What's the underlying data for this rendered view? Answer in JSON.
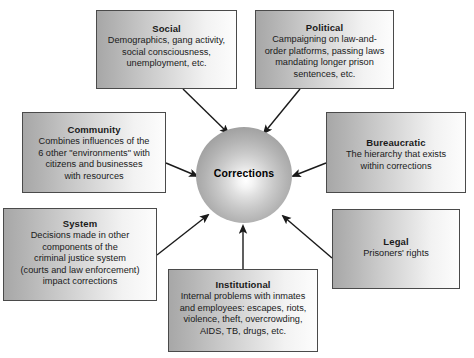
{
  "diagram": {
    "center": {
      "label": "Corrections",
      "shape": "sphere"
    },
    "colors": {
      "box_border": "#4a4a4a",
      "box_gradient_from": "#a7a7a7",
      "box_gradient_to": "#fdfdfd",
      "arrow": "#1a1a1a",
      "text": "#1a1a1a",
      "background": "#ffffff"
    },
    "nodes": [
      {
        "id": "social",
        "title": "Social",
        "body": "Demographics, gang activity,\nsocial consciousness,\nunemployment, etc."
      },
      {
        "id": "political",
        "title": "Political",
        "body": "Campaigning on law-and-\norder platforms, passing laws\nmandating longer prison\nsentences, etc."
      },
      {
        "id": "community",
        "title": "Community",
        "body": "Combines influences of the\n6 other \"environments\" with\ncitizens and businesses\nwith resources"
      },
      {
        "id": "bureaucratic",
        "title": "Bureaucratic",
        "body": "The hierarchy that exists\nwithin corrections"
      },
      {
        "id": "system",
        "title": "System",
        "body": "Decisions made in other\ncomponents of the\ncriminal justice system\n(courts and law enforcement)\nimpact corrections"
      },
      {
        "id": "legal",
        "title": "Legal",
        "body": "Prisoners' rights"
      },
      {
        "id": "institutional",
        "title": "Institutional",
        "body": "Internal problems with inmates\nand employees: escapes, riots,\nviolence, theft, overcrowding,\nAIDS, TB, drugs, etc."
      }
    ],
    "arrows": [
      {
        "from": "social",
        "to": "center",
        "direction": "down-right"
      },
      {
        "from": "political",
        "to": "center",
        "direction": "down-left"
      },
      {
        "from": "community",
        "to": "center",
        "direction": "right"
      },
      {
        "from": "bureaucratic",
        "to": "center",
        "direction": "left"
      },
      {
        "from": "system",
        "to": "center",
        "direction": "up-right"
      },
      {
        "from": "legal",
        "to": "center",
        "direction": "up-left"
      },
      {
        "from": "institutional",
        "to": "center",
        "direction": "up"
      }
    ]
  }
}
